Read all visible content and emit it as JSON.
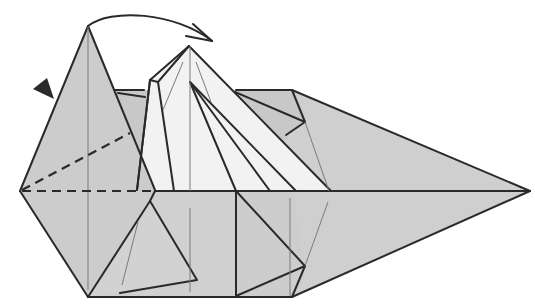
{
  "diagram": {
    "colors": {
      "ink": "#2a2a2a",
      "thin": "#7a7a7a",
      "shade": "#cfcfcf",
      "shade_dark": "#c4c4c4",
      "light": "#f2f2f2"
    },
    "symbols": [
      {
        "name": "push-marker",
        "type": "filled-triangle",
        "position": [
          38,
          92
        ]
      },
      {
        "name": "fold-over-arrow",
        "type": "curved-arrow",
        "from": [
          88,
          26
        ],
        "to": [
          213,
          42
        ]
      },
      {
        "name": "valley-fold-line-horizontal",
        "type": "dashed-line"
      },
      {
        "name": "valley-fold-line-diagonal",
        "type": "dashed-line"
      }
    ]
  }
}
